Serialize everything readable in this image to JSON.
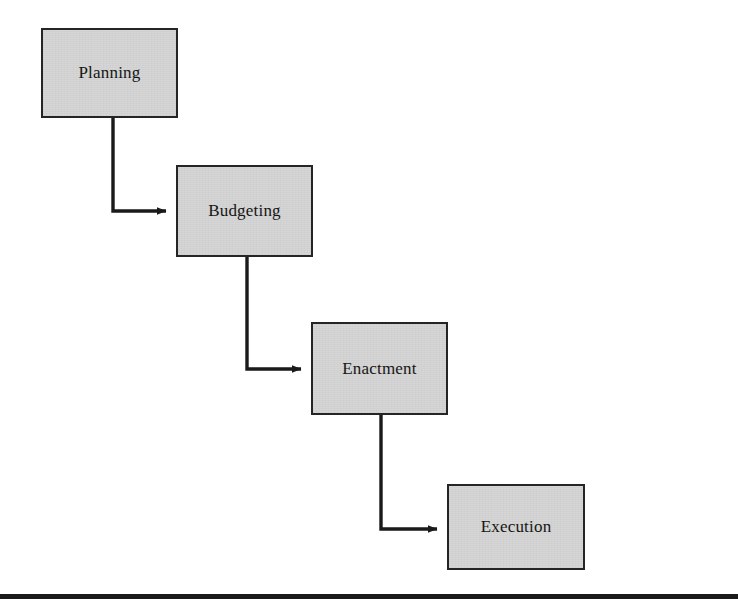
{
  "diagram": {
    "type": "flowchart",
    "orientation": "cascading-staircase",
    "title": "",
    "background_color": "#ffffff",
    "node_fill_color": "#d5d5d5",
    "node_border_color": "#252525",
    "connector_color": "#1a1a1a",
    "text_color": "#121212",
    "nodes": [
      {
        "id": "planning",
        "label": "Planning",
        "x": 41,
        "y": 28,
        "width": 137,
        "height": 90
      },
      {
        "id": "budgeting",
        "label": "Budgeting",
        "x": 176,
        "y": 165,
        "width": 137,
        "height": 92
      },
      {
        "id": "enactment",
        "label": "Enactment",
        "x": 311,
        "y": 322,
        "width": 137,
        "height": 93
      },
      {
        "id": "execution",
        "label": "Execution",
        "x": 447,
        "y": 484,
        "width": 138,
        "height": 86
      }
    ],
    "edges": [
      {
        "id": "planning-to-budgeting",
        "from": "planning",
        "to": "budgeting",
        "style": "elbow",
        "arrowhead": "solid-triangle"
      },
      {
        "id": "budgeting-to-enactment",
        "from": "budgeting",
        "to": "enactment",
        "style": "elbow",
        "arrowhead": "solid-triangle"
      },
      {
        "id": "enactment-to-execution",
        "from": "enactment",
        "to": "execution",
        "style": "elbow",
        "arrowhead": "solid-triangle"
      }
    ],
    "footer_rule": {
      "y": 594,
      "height": 5,
      "color": "#1a1a1a"
    }
  }
}
